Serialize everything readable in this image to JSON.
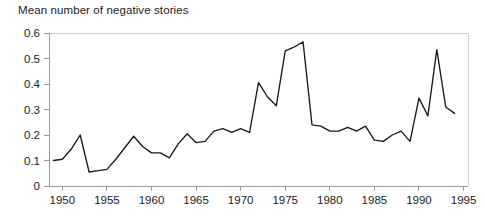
{
  "chart_data": {
    "type": "line",
    "title": "Mean number of negative stories",
    "xlabel": "",
    "ylabel": "",
    "xlim": [
      1948.5,
      1995.5
    ],
    "ylim": [
      0,
      0.6
    ],
    "grid": false,
    "legend": null,
    "y_ticks": [
      "0",
      "0.1",
      "0.2",
      "0.3",
      "0.4",
      "0.5",
      "0.6"
    ],
    "y_tick_values": [
      0,
      0.1,
      0.2,
      0.3,
      0.4,
      0.5,
      0.6
    ],
    "x_ticks": [
      "1950",
      "1955",
      "1960",
      "1965",
      "1970",
      "1975",
      "1980",
      "1985",
      "1990",
      "1995"
    ],
    "x_tick_values": [
      1950,
      1955,
      1960,
      1965,
      1970,
      1975,
      1980,
      1985,
      1990,
      1995
    ],
    "series": [
      {
        "name": "Mean number of negative stories",
        "x": [
          1949,
          1950,
          1951,
          1952,
          1953,
          1954,
          1955,
          1956,
          1957,
          1958,
          1959,
          1960,
          1961,
          1962,
          1963,
          1964,
          1965,
          1966,
          1967,
          1968,
          1969,
          1970,
          1971,
          1972,
          1973,
          1974,
          1975,
          1976,
          1977,
          1978,
          1979,
          1980,
          1981,
          1982,
          1983,
          1984,
          1985,
          1986,
          1987,
          1988,
          1989,
          1990,
          1991,
          1992,
          1993,
          1994
        ],
        "values": [
          0.1,
          0.105,
          0.145,
          0.2,
          0.055,
          0.06,
          0.065,
          0.105,
          0.15,
          0.195,
          0.155,
          0.13,
          0.13,
          0.11,
          0.165,
          0.205,
          0.17,
          0.175,
          0.215,
          0.225,
          0.21,
          0.225,
          0.21,
          0.405,
          0.35,
          0.315,
          0.53,
          0.545,
          0.565,
          0.24,
          0.235,
          0.215,
          0.215,
          0.23,
          0.215,
          0.235,
          0.18,
          0.175,
          0.2,
          0.215,
          0.175,
          0.345,
          0.275,
          0.535,
          0.31,
          0.285
        ]
      }
    ]
  },
  "plot_geometry": {
    "x_left_px": 49,
    "x_right_px": 468,
    "y_top_px": 33,
    "y_bottom_px": 186,
    "x_min_year": 1948.5,
    "x_max_year": 1995.5,
    "y_min_val": 0,
    "y_max_val": 0.6
  }
}
